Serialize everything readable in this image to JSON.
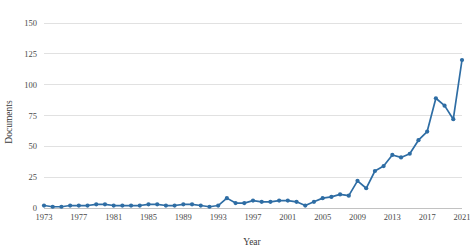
{
  "chart_data": {
    "type": "line",
    "title": "",
    "xlabel": "Year",
    "ylabel": "Documents",
    "xlim": [
      1973,
      2021
    ],
    "ylim": [
      0,
      150
    ],
    "ytick_values": [
      0,
      25,
      50,
      75,
      100,
      125,
      150
    ],
    "ytick_labels": [
      "0",
      "25",
      "50",
      "75",
      "100",
      "125",
      "150"
    ],
    "xtick_values": [
      1973,
      1977,
      1981,
      1985,
      1989,
      1993,
      1997,
      2001,
      2005,
      2009,
      2013,
      2017,
      2021
    ],
    "xtick_labels": [
      "1973",
      "1977",
      "1981",
      "1985",
      "1989",
      "1993",
      "1997",
      "2001",
      "2005",
      "2009",
      "2013",
      "2017",
      "2021"
    ],
    "grid": "horizontal",
    "legend": "none",
    "marker": "circle",
    "series": [
      {
        "name": "Documents",
        "color": "#2e6da4",
        "x": [
          1973,
          1974,
          1975,
          1976,
          1977,
          1978,
          1979,
          1980,
          1981,
          1982,
          1983,
          1984,
          1985,
          1986,
          1987,
          1988,
          1989,
          1990,
          1991,
          1992,
          1993,
          1994,
          1995,
          1996,
          1997,
          1998,
          1999,
          2000,
          2001,
          2002,
          2003,
          2004,
          2005,
          2006,
          2007,
          2008,
          2009,
          2010,
          2011,
          2012,
          2013,
          2014,
          2015,
          2016,
          2017,
          2018,
          2019,
          2020,
          2021
        ],
        "values": [
          2,
          1,
          1,
          2,
          2,
          2,
          3,
          3,
          2,
          2,
          2,
          2,
          3,
          3,
          2,
          2,
          3,
          3,
          2,
          1,
          2,
          8,
          4,
          4,
          6,
          5,
          5,
          6,
          6,
          5,
          2,
          5,
          8,
          9,
          11,
          10,
          22,
          16,
          30,
          34,
          43,
          41,
          44,
          55,
          62,
          89,
          83,
          72,
          120
        ]
      }
    ]
  },
  "axis": {
    "ylabel_text": "Documents",
    "xlabel_text": "Year"
  }
}
